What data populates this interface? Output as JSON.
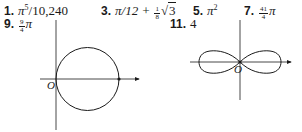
{
  "answers": [
    {
      "number": "1.",
      "expr_main": "π",
      "expr_sup": "5",
      "expr_rest": "/10,240"
    },
    {
      "number": "3.",
      "expr_main": "π/12 + ",
      "frac_num": "1",
      "frac_den": "8",
      "sqrt_arg": "3"
    },
    {
      "number": "5.",
      "expr_main": "π",
      "expr_sup": "2"
    },
    {
      "number": "7.",
      "frac_num": "41",
      "frac_den": "4",
      "expr_main": "π"
    },
    {
      "number": "9.",
      "frac_num": "9",
      "frac_den": "4",
      "expr_main": "π"
    },
    {
      "number": "11.",
      "expr_main": "4"
    }
  ],
  "figures": {
    "circle": {
      "origin_label": "O",
      "center": [
        87.5,
        79
      ],
      "radius": 31.5
    },
    "lemniscate": {
      "origin_label": "O",
      "center": [
        240,
        62
      ],
      "half_width": 39
    }
  },
  "colors": {
    "ink": "#1a1a1a",
    "background": "#ffffff"
  }
}
